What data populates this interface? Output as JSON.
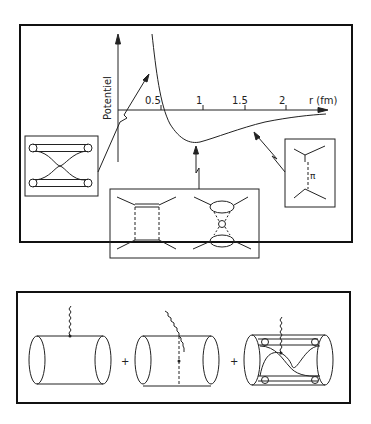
{
  "top_panel": {
    "y_axis_label": "Potentiel",
    "x_axis_label": "r (fm)",
    "x_ticks": [
      "0.5",
      "1",
      "1.5",
      "2"
    ],
    "pion_label": "π",
    "insets": [
      {
        "name": "quark-exchange",
        "description": "short-range quark exchange box"
      },
      {
        "name": "two-pion-exchange",
        "description": "intermediate-range box and crossed diagrams"
      },
      {
        "name": "one-pion-exchange",
        "description": "long-range pion exchange"
      }
    ]
  },
  "bottom_panel": {
    "plus_1": "+",
    "plus_2": "+",
    "terms": [
      "one-body current",
      "pion exchange current",
      "quark exchange current"
    ]
  }
}
